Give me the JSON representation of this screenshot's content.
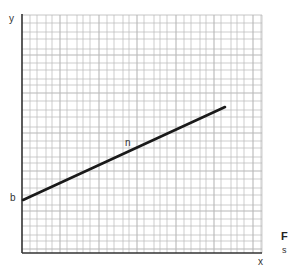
{
  "chart_data": {
    "type": "line",
    "title": "",
    "xlabel": "x",
    "ylabel": "y",
    "grid": true,
    "legend": null,
    "series": [
      {
        "name": "n",
        "points": [
          [
            0,
            0.23
          ],
          [
            0.85,
            0.61
          ]
        ],
        "intercept_label": "b",
        "color": "#1a1a1a"
      }
    ],
    "annotations": [
      {
        "text": "n",
        "position": "above line midpoint"
      },
      {
        "text": "b",
        "position": "y-intercept"
      }
    ],
    "xlim": [
      0,
      1
    ],
    "ylim": [
      0,
      1
    ]
  },
  "labels": {
    "y_axis": "y",
    "x_axis": "x",
    "intercept": "b",
    "line_name": "n",
    "fig_partial": "F",
    "sub_partial": "s"
  },
  "colors": {
    "axis": "#333333",
    "grid": "#b8b8b8",
    "line": "#1a1a1a"
  }
}
